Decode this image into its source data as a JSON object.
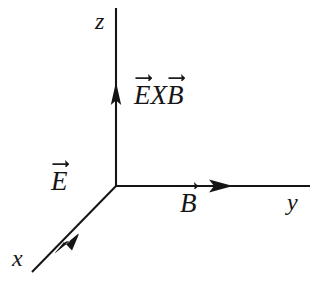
{
  "figure": {
    "background_color": "#ffffff",
    "stroke_color": "#151515",
    "axes": [
      {
        "id": "z",
        "label": "z",
        "direction": "up",
        "origin": [
          116,
          186
        ],
        "end": [
          116,
          8
        ],
        "arrow_tip": [
          116,
          83
        ]
      },
      {
        "id": "y",
        "label": "y",
        "direction": "right",
        "origin": [
          116,
          186
        ],
        "end": [
          310,
          186
        ],
        "arrow_tip": [
          232,
          186
        ]
      },
      {
        "id": "x",
        "label": "x",
        "direction": "down-left",
        "origin": [
          116,
          186
        ],
        "end": [
          32,
          272
        ],
        "arrow_tip": [
          55,
          253
        ]
      }
    ],
    "vector_labels": [
      {
        "id": "E",
        "symbol": "E",
        "text": "E",
        "arrow": true
      },
      {
        "id": "B",
        "symbol": "B",
        "text": "B",
        "arrow": true
      },
      {
        "id": "ExB",
        "text": "E X B",
        "left_symbol": "E",
        "operator": "X",
        "right_symbol": "B",
        "arrow": true
      }
    ]
  },
  "labels": {
    "z_axis": "z",
    "y_axis": "y",
    "x_axis": "x",
    "e_vector": "E",
    "b_vector": "B",
    "cross_operator": "X",
    "exb_left": "E",
    "exb_right": "B"
  }
}
